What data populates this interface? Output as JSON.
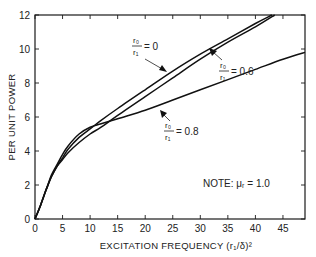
{
  "chart_data": {
    "type": "line",
    "title": "",
    "xlabel": "EXCITATION FREQUENCY (r₁/δ)²",
    "ylabel": "PER UNIT POWER",
    "xlim": [
      0,
      49
    ],
    "ylim": [
      0,
      12
    ],
    "grid": false,
    "x_ticks": [
      0,
      5,
      10,
      15,
      20,
      25,
      30,
      35,
      40,
      45
    ],
    "y_ticks": [
      0,
      2,
      4,
      6,
      8,
      10,
      12
    ],
    "annotation_note": "NOTE: μᵣ = 1.0",
    "series": [
      {
        "name": "r0/r1 = 0",
        "label_num": "r₀",
        "label_den": "r₁",
        "label_value": "= 0",
        "x": [
          0,
          1,
          2,
          3,
          4,
          5,
          6,
          8,
          10,
          12,
          15,
          20,
          25,
          30,
          35,
          40,
          43
        ],
        "y": [
          0,
          0.8,
          1.7,
          2.5,
          3.1,
          3.6,
          4.1,
          4.8,
          5.3,
          5.8,
          6.5,
          7.6,
          8.7,
          9.7,
          10.6,
          11.5,
          12.0
        ]
      },
      {
        "name": "r0/r1 = 0.6",
        "label_num": "r₀",
        "label_den": "r₁",
        "label_value": "= 0.6",
        "x": [
          0,
          1,
          2,
          3,
          4,
          5,
          6,
          8,
          10,
          12,
          15,
          20,
          25,
          30,
          35,
          40,
          43.5
        ],
        "y": [
          0,
          0.8,
          1.7,
          2.5,
          3.1,
          3.5,
          3.9,
          4.5,
          5.0,
          5.4,
          6.1,
          7.2,
          8.3,
          9.4,
          10.4,
          11.3,
          12.0
        ]
      },
      {
        "name": "r0/r1 = 0.8",
        "label_num": "r₀",
        "label_den": "r₁",
        "label_value": "= 0.8",
        "x": [
          0,
          1,
          2,
          3,
          4,
          5,
          6,
          8,
          10,
          12,
          15,
          20,
          25,
          30,
          35,
          40,
          45,
          49
        ],
        "y": [
          0,
          0.8,
          1.7,
          2.6,
          3.2,
          3.8,
          4.3,
          5.0,
          5.4,
          5.6,
          5.9,
          6.4,
          7.0,
          7.6,
          8.2,
          8.8,
          9.4,
          9.8
        ]
      }
    ]
  }
}
